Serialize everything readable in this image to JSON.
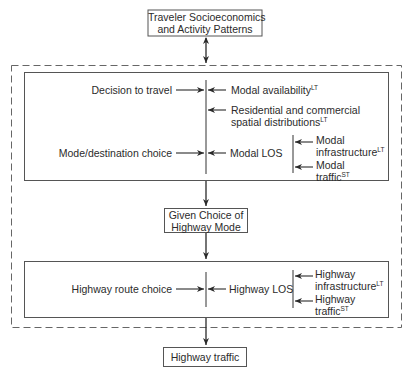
{
  "diagram": {
    "top_box": {
      "line1": "Traveler Socioeconomics",
      "line2": "and Activity Patterns"
    },
    "stage1": {
      "decision_to_travel": "Decision to travel",
      "modal_availability": "Modal availability",
      "modal_availability_sup": "LT",
      "residential_line1": "Residential and commercial",
      "residential_line2": "spatial distributions",
      "residential_sup": "LT",
      "mode_destination_choice": "Mode/destination choice",
      "modal_los": "Modal LOS",
      "modal_infrastructure_line1": "Modal",
      "modal_infrastructure_line2": "infrastructure",
      "modal_infrastructure_sup": "LT",
      "modal_traffic_line1": "Modal",
      "modal_traffic_line2": "traffic",
      "modal_traffic_sup": "ST"
    },
    "middle_box": {
      "line1": "Given Choice of",
      "line2": "Highway Mode"
    },
    "stage2": {
      "highway_route_choice": "Highway route choice",
      "highway_los": "Highway LOS",
      "highway_infrastructure_line1": "Highway",
      "highway_infrastructure_line2": "infrastructure",
      "highway_infrastructure_sup": "LT",
      "highway_traffic_line1": "Highway",
      "highway_traffic_line2": "traffic",
      "highway_traffic_sup": "ST"
    },
    "bottom_box": {
      "label": "Highway traffic"
    }
  }
}
